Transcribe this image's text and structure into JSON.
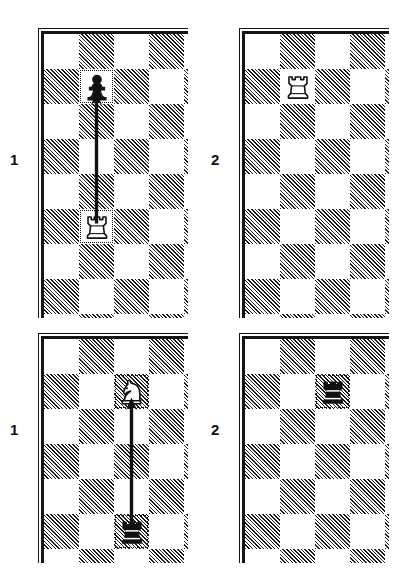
{
  "diagram": {
    "type": "chess-move-diagrams",
    "board_geometry": {
      "square_px": 35,
      "cols_visible": 4.4,
      "rows_visible": 8.1,
      "light_color": "#ffffff",
      "dark_color_hatch": "#1a1a1a",
      "border_color": "#141414",
      "highlight_style": "dotted"
    },
    "panels": [
      {
        "id": "panel-1-top",
        "label": "1",
        "label_pos": {
          "x": 10,
          "y": 152
        },
        "board_pos": {
          "x": 38,
          "y": 28,
          "w": 150,
          "h": 290
        },
        "first_square_dark": false,
        "pieces": [
          {
            "name": "black-pawn",
            "color": "black",
            "type": "pawn",
            "col": 1,
            "row": 1,
            "marked": true
          },
          {
            "name": "white-rook",
            "color": "white",
            "type": "rook",
            "col": 1,
            "row": 5,
            "marked": true
          }
        ],
        "arrows": [
          {
            "name": "rook-advance-arrow",
            "from_col": 1,
            "from_row": 5,
            "to_col": 1,
            "to_row": 1
          }
        ]
      },
      {
        "id": "panel-2-top",
        "label": "2",
        "label_pos": {
          "x": 211,
          "y": 152
        },
        "board_pos": {
          "x": 239,
          "y": 28,
          "w": 150,
          "h": 290
        },
        "first_square_dark": false,
        "pieces": [
          {
            "name": "white-rook",
            "color": "white",
            "type": "rook",
            "col": 1,
            "row": 1,
            "marked": false
          }
        ],
        "arrows": []
      },
      {
        "id": "panel-1-bottom",
        "label": "1",
        "label_pos": {
          "x": 10,
          "y": 422
        },
        "board_pos": {
          "x": 38,
          "y": 333,
          "w": 150,
          "h": 230
        },
        "first_square_dark": false,
        "pieces": [
          {
            "name": "white-knight",
            "color": "white",
            "type": "knight",
            "col": 2,
            "row": 1,
            "marked": true
          },
          {
            "name": "black-rook",
            "color": "black",
            "type": "rook",
            "col": 2,
            "row": 5,
            "marked": true
          }
        ],
        "arrows": [
          {
            "name": "rook-advance-arrow",
            "from_col": 2,
            "from_row": 5,
            "to_col": 2,
            "to_row": 1
          }
        ]
      },
      {
        "id": "panel-2-bottom",
        "label": "2",
        "label_pos": {
          "x": 211,
          "y": 422
        },
        "board_pos": {
          "x": 239,
          "y": 333,
          "w": 150,
          "h": 230
        },
        "first_square_dark": false,
        "pieces": [
          {
            "name": "black-rook",
            "color": "black",
            "type": "rook",
            "col": 2,
            "row": 1,
            "marked": true
          }
        ],
        "arrows": []
      }
    ]
  }
}
